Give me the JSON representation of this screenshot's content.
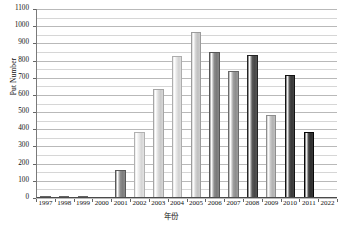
{
  "chart_data": {
    "type": "bar",
    "title": "",
    "subtitle": "",
    "xlabel": "年份",
    "ylabel": "Put Number",
    "categories": [
      "1997",
      "1998",
      "1999",
      "2000",
      "2001",
      "2002",
      "2003",
      "2004",
      "2005",
      "2006",
      "2007",
      "2008",
      "2009",
      "2010",
      "2011",
      "2022"
    ],
    "values": [
      8,
      5,
      8,
      0,
      163,
      383,
      635,
      825,
      968,
      850,
      740,
      835,
      485,
      715,
      385,
      null
    ],
    "ylim": [
      0,
      1100
    ],
    "y_tick_step": 100,
    "y_minor_step": 50,
    "y_ticks": [
      "0",
      "100",
      "200",
      "300",
      "400",
      "500",
      "600",
      "700",
      "800",
      "900",
      "1000",
      "1100"
    ],
    "grid": true,
    "grid_axis": "y",
    "legend": false,
    "legend_position": "none",
    "bar_style": "vertical-gradient-stripe",
    "bar_colors": [
      "#9a9a9a",
      "#9a9a9a",
      "#9a9a9a",
      "#bdbdbd",
      "#8f8f8f",
      "#e8e8e8",
      "#dcdcdc",
      "#e4e4e4",
      "#d2d2d2",
      "#8c8c8c",
      "#a0a0a0",
      "#5a5a5a",
      "#c4c4c4",
      "#4a4a4a",
      "#3f3f3f",
      "#ffffff"
    ]
  },
  "axis": {
    "y_title": "Put Number",
    "x_title": "年份"
  },
  "colors": {
    "background": "#ffffff",
    "gridline_major": "#b9b9b9",
    "gridline_minor": "#d6d6d6",
    "axis": "#4a4a4a",
    "text": "#111111"
  }
}
